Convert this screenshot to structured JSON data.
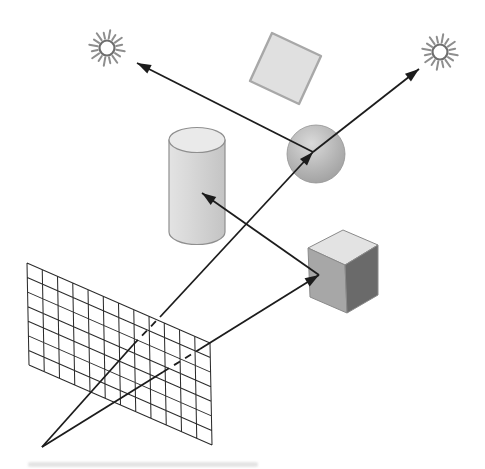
{
  "diagram": {
    "kind": "ray-tracing-scene",
    "canvas": {
      "width": 485,
      "height": 469,
      "background": "#ffffff"
    },
    "colors": {
      "ray_line": "#1c1c1c",
      "grid_line": "#2c2c2c",
      "sun_ray": "#8e8e8e",
      "sun_ring": "#6e6e6e",
      "sun_core": "#ffffff",
      "square_fill": "#e0e0e0",
      "square_stroke": "#a8a8a8",
      "sphere_light": "#dadada",
      "sphere_mid": "#b4b4b4",
      "sphere_dark": "#9c9c9c",
      "sphere_stroke": "#939393",
      "cylinder_light": "#e3e3e3",
      "cylinder_mid": "#d9d9d9",
      "cylinder_dark": "#c4c4c4",
      "cylinder_top_fill": "#eaeaea",
      "cylinder_stroke": "#8f8f8f",
      "cube_top_fill": "#e3e3e3",
      "cube_left_fill": "#a7a7a7",
      "cube_right_fill": "#6a6a6a",
      "cube_stroke": "#8a8a8a",
      "artifact_gray": "#c4c4c4"
    },
    "lights": [
      {
        "name": "light-source-left",
        "cx": 107,
        "cy": 48,
        "ring_r": 7.5,
        "ray_inner": 9.5,
        "ray_outer_long": 18,
        "ray_outer_short": 15.5,
        "ray_count": 16,
        "ray_width": 2
      },
      {
        "name": "light-source-right",
        "cx": 440,
        "cy": 52,
        "ring_r": 7.5,
        "ray_inner": 9.5,
        "ray_outer_long": 18,
        "ray_outer_short": 15.5,
        "ray_count": 16,
        "ray_width": 2
      }
    ],
    "square": {
      "points": [
        [
          272,
          33
        ],
        [
          321,
          56
        ],
        [
          299,
          104
        ],
        [
          250,
          81
        ]
      ],
      "stroke_width": 2.4
    },
    "sphere": {
      "cx": 316,
      "cy": 154,
      "r": 29
    },
    "cylinder": {
      "left_x": 169,
      "right_x": 225,
      "top_cy": 140,
      "bottom_cy": 232,
      "rx": 28,
      "ry": 12.5,
      "stroke_width": 1.2
    },
    "cube": {
      "top_face": [
        [
          343,
          230
        ],
        [
          378,
          245
        ],
        [
          345,
          265
        ],
        [
          308,
          248
        ]
      ],
      "left_face": [
        [
          308,
          248
        ],
        [
          345,
          265
        ],
        [
          347,
          313
        ],
        [
          310,
          297
        ]
      ],
      "right_face": [
        [
          345,
          265
        ],
        [
          378,
          245
        ],
        [
          378,
          295
        ],
        [
          347,
          313
        ]
      ],
      "stroke_width": 1
    },
    "image_plane_grid": {
      "tl": [
        27,
        263
      ],
      "tr": [
        210,
        343
      ],
      "bl": [
        29,
        365
      ],
      "cols": 12,
      "rows": 7,
      "stroke_width": 1.05
    },
    "eye_point": [
      42,
      447
    ],
    "rays": [
      {
        "name": "eye-ray-to-sphere",
        "segments": [
          {
            "from": [
              42,
              447
            ],
            "to": [
              133,
              345
            ],
            "dashed": false
          },
          {
            "from": [
              133,
              345
            ],
            "to": [
              160,
              317
            ],
            "dashed": true
          },
          {
            "from": [
              160,
              317
            ],
            "to": [
              313,
              152
            ],
            "dashed": false
          }
        ],
        "arrow": true
      },
      {
        "name": "eye-ray-to-cube",
        "segments": [
          {
            "from": [
              42,
              447
            ],
            "to": [
              163,
              372
            ],
            "dashed": false
          },
          {
            "from": [
              163,
              372
            ],
            "to": [
              200,
              349
            ],
            "dashed": true
          },
          {
            "from": [
              200,
              349
            ],
            "to": [
              319,
              275
            ],
            "dashed": false
          }
        ],
        "arrow": true
      },
      {
        "name": "shadow-ray-sphere-to-left-light",
        "segments": [
          {
            "from": [
              313,
              152
            ],
            "to": [
              137,
              63
            ],
            "dashed": false
          }
        ],
        "arrow": true
      },
      {
        "name": "shadow-ray-sphere-to-right-light",
        "segments": [
          {
            "from": [
              313,
              152
            ],
            "to": [
              419,
              69
            ],
            "dashed": false
          }
        ],
        "arrow": true
      },
      {
        "name": "shadow-ray-cube-to-cylinder",
        "segments": [
          {
            "from": [
              319,
              275
            ],
            "to": [
              202,
              193
            ],
            "dashed": false
          }
        ],
        "arrow": true
      }
    ],
    "ray_style": {
      "width": 1.8,
      "dash": "7 6",
      "arrow_length": 14,
      "arrow_half_width": 4.8
    },
    "caption_artifact": {
      "x": 28,
      "y": 462,
      "width": 230,
      "height": 5,
      "opacity": 0.45
    }
  }
}
